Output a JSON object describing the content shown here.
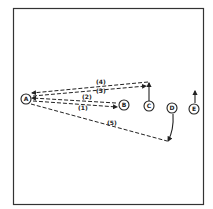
{
  "diagram": {
    "type": "play-diagram",
    "frame": {
      "stroke": "#333333"
    },
    "nodes": [
      {
        "id": "A",
        "label": "A"
      },
      {
        "id": "B",
        "label": "B"
      },
      {
        "id": "C",
        "label": "C"
      },
      {
        "id": "D",
        "label": "D"
      },
      {
        "id": "E",
        "label": "E"
      }
    ],
    "passes": [
      {
        "label": "(1)",
        "from": "A",
        "to": "B",
        "style": "dashed"
      },
      {
        "label": "(2)",
        "from": "B",
        "to": "A",
        "style": "dashed"
      },
      {
        "label": "(3)",
        "from": "A",
        "to": "C",
        "style": "dashed"
      },
      {
        "label": "(4)",
        "from": "C",
        "to": "A",
        "style": "dashed"
      },
      {
        "label": "(5)",
        "from": "A",
        "to": "D",
        "style": "dashed"
      }
    ],
    "runs": [
      {
        "player": "C",
        "direction": "up"
      },
      {
        "player": "D",
        "direction": "down"
      },
      {
        "player": "E",
        "direction": "up"
      }
    ]
  }
}
